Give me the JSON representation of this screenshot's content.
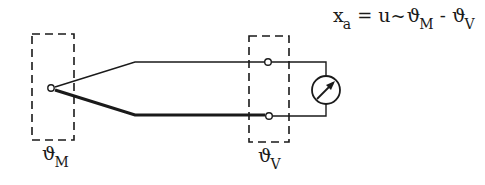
{
  "diagram": {
    "type": "thermocouple circuit",
    "formula": {
      "lhs_symbol": "x",
      "lhs_sub": "a",
      "eq": "=",
      "u": "u",
      "prop": "~",
      "theta1": "ϑ",
      "theta1_sub": "M",
      "minus": "-",
      "theta2": "ϑ",
      "theta2_sub": "V"
    },
    "measuring_junction": {
      "symbol": "ϑ",
      "sub": "M"
    },
    "reference_junction": {
      "symbol": "ϑ",
      "sub": "V"
    },
    "components": [
      "measuring-junction-box",
      "reference-junction-box",
      "thin-wire",
      "thick-wire",
      "terminal-top",
      "terminal-bottom",
      "meter"
    ],
    "colors": {
      "line": "#1a1a1a",
      "background": "#ffffff"
    }
  }
}
